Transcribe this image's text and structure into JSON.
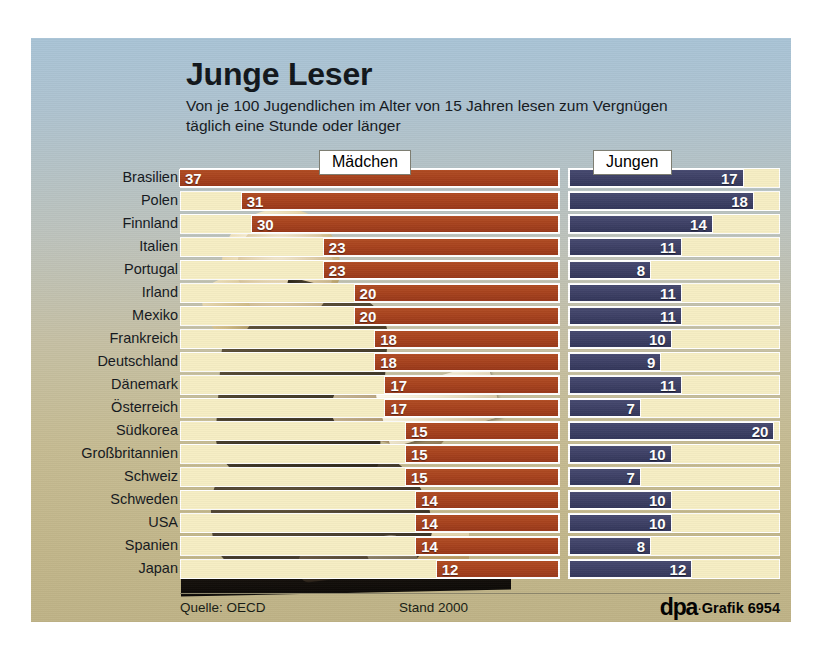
{
  "title": "Junge Leser",
  "subtitle": "Von je 100 Jugendlichen im Alter von 15 Jahren lesen zum Vergnügen täglich eine Stunde oder länger",
  "legend": {
    "girls": "Mädchen",
    "boys": "Jungen"
  },
  "footer": {
    "source": "Quelle: OECD",
    "date": "Stand 2000",
    "agency": "dpa",
    "separator": "·",
    "graphic_id": "Grafik 6954"
  },
  "colors": {
    "girls_bar": "#a8431e",
    "boys_bar": "#3e4166",
    "track": "#f6eec4",
    "background_top": "#a9c4d6",
    "background_bottom": "#bfb387"
  },
  "chart_data": {
    "type": "bar",
    "title": "Junge Leser",
    "subtitle": "Von je 100 Jugendlichen im Alter von 15 Jahren lesen zum Vergnügen täglich eine Stunde oder länger",
    "xlabel": "",
    "ylabel": "",
    "orientation": "horizontal",
    "grouping": "diverging-paired",
    "unit": "von je 100",
    "xlim": [
      0,
      37
    ],
    "grid": false,
    "legend_position": "top",
    "categories": [
      "Brasilien",
      "Polen",
      "Finnland",
      "Italien",
      "Portugal",
      "Irland",
      "Mexiko",
      "Frankreich",
      "Deutschland",
      "Dänemark",
      "Österreich",
      "Südkorea",
      "Großbritannien",
      "Schweiz",
      "Schweden",
      "USA",
      "Spanien",
      "Japan"
    ],
    "series": [
      {
        "name": "Mädchen",
        "color": "#a8431e",
        "align": "right",
        "values": [
          37,
          31,
          30,
          23,
          23,
          20,
          20,
          18,
          18,
          17,
          17,
          15,
          15,
          15,
          14,
          14,
          14,
          12
        ]
      },
      {
        "name": "Jungen",
        "color": "#3e4166",
        "align": "left",
        "values": [
          17,
          18,
          14,
          11,
          8,
          11,
          11,
          10,
          9,
          11,
          7,
          20,
          10,
          7,
          10,
          10,
          8,
          12
        ]
      }
    ]
  }
}
